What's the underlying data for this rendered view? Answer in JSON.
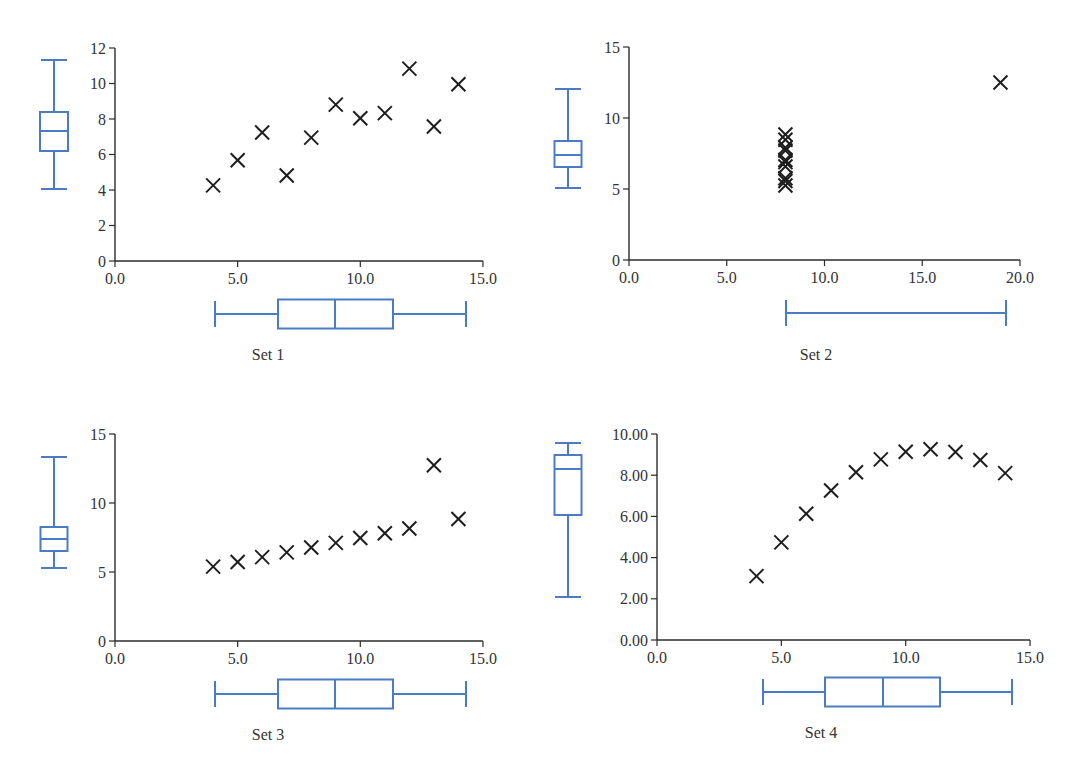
{
  "figure": {
    "accent_color": "#4a7cc4",
    "marker_color": "#1e1e1e",
    "marker": "x-cross"
  },
  "chart_data": [
    {
      "type": "scatter",
      "title": "Set 1",
      "xlabel": "",
      "ylabel": "",
      "xlim": [
        0,
        15
      ],
      "ylim": [
        0,
        12
      ],
      "xticks": [
        "0.0",
        "5.0",
        "10.0",
        "15.0"
      ],
      "xtick_values": [
        0,
        5,
        10,
        15
      ],
      "yticks": [
        "0",
        "2",
        "4",
        "6",
        "8",
        "10",
        "12"
      ],
      "ytick_values": [
        0,
        2,
        4,
        6,
        8,
        10,
        12
      ],
      "grid": false,
      "x": [
        10,
        8,
        13,
        9,
        11,
        14,
        6,
        4,
        12,
        7,
        5
      ],
      "y": [
        8.04,
        6.95,
        7.58,
        8.81,
        8.33,
        9.96,
        7.24,
        4.26,
        10.84,
        4.82,
        5.68
      ],
      "marginal_boxplot_x": {
        "min": 4,
        "q1": 6.5,
        "median": 9,
        "q3": 11.5,
        "max": 14
      },
      "marginal_boxplot_y": {
        "min": 4.26,
        "q1": 6.31,
        "median": 7.58,
        "q3": 8.57,
        "max": 10.84
      },
      "layout": {
        "ox": 115,
        "oy": 261,
        "xscale": 24.53,
        "yscale": 17.75,
        "vbox": {
          "cx": 54,
          "w": 28,
          "top": 60,
          "q3": 112,
          "med": 131,
          "q1": 151,
          "bot": 189
        },
        "hbox": {
          "cy": 314,
          "h": 29,
          "left": 215,
          "q1": 278,
          "med": 335,
          "q3": 393,
          "right": 466
        },
        "label": {
          "x": 268,
          "y": 360
        }
      }
    },
    {
      "type": "scatter",
      "title": "Set 2",
      "xlabel": "",
      "ylabel": "",
      "xlim": [
        0,
        20
      ],
      "ylim": [
        0,
        15
      ],
      "xticks": [
        "0.0",
        "5.0",
        "10.0",
        "15.0",
        "20.0"
      ],
      "xtick_values": [
        0,
        5,
        10,
        15,
        20
      ],
      "yticks": [
        "0",
        "5",
        "10",
        "15"
      ],
      "ytick_values": [
        0,
        5,
        10,
        15
      ],
      "grid": false,
      "x": [
        8,
        8,
        8,
        8,
        8,
        8,
        8,
        19,
        8,
        8,
        8
      ],
      "y": [
        6.58,
        5.76,
        7.71,
        8.84,
        8.47,
        7.04,
        5.25,
        12.5,
        5.56,
        7.91,
        6.89
      ],
      "marginal_boxplot_x": {
        "min": 8,
        "q1": 8,
        "median": 8,
        "q3": 8,
        "max": 19
      },
      "marginal_boxplot_y": {
        "min": 5.25,
        "q1": 6.17,
        "median": 7.04,
        "q3": 8.19,
        "max": 12.5
      },
      "layout": {
        "ox": 629,
        "oy": 260,
        "xscale": 19.55,
        "yscale": 14.2,
        "vbox": {
          "cx": 568,
          "w": 27,
          "top": 89,
          "q3": 141,
          "med": 155,
          "q1": 167,
          "bot": 188
        },
        "hbox": {
          "cy": 313,
          "h": 0,
          "left": 786,
          "q1": 786,
          "med": 786,
          "q3": 786,
          "right": 1006
        },
        "label": {
          "x": 816,
          "y": 360
        }
      }
    },
    {
      "type": "scatter",
      "title": "Set 3",
      "xlabel": "",
      "ylabel": "",
      "xlim": [
        0,
        15
      ],
      "ylim": [
        0,
        15
      ],
      "xticks": [
        "0.0",
        "5.0",
        "10.0",
        "15.0"
      ],
      "xtick_values": [
        0,
        5,
        10,
        15
      ],
      "yticks": [
        "0",
        "5",
        "10",
        "15"
      ],
      "ytick_values": [
        0,
        5,
        10,
        15
      ],
      "grid": false,
      "x": [
        10,
        8,
        13,
        9,
        11,
        14,
        6,
        4,
        12,
        7,
        5
      ],
      "y": [
        7.46,
        6.77,
        12.74,
        7.11,
        7.81,
        8.84,
        6.08,
        5.39,
        8.15,
        6.42,
        5.73
      ],
      "marginal_boxplot_x": {
        "min": 4,
        "q1": 6.5,
        "median": 9,
        "q3": 11.5,
        "max": 14
      },
      "marginal_boxplot_y": {
        "min": 5.39,
        "q1": 6.25,
        "median": 7.11,
        "q3": 7.98,
        "max": 12.74
      },
      "layout": {
        "ox": 115,
        "oy": 641,
        "xscale": 24.53,
        "yscale": 13.8,
        "vbox": {
          "cx": 54,
          "w": 27,
          "top": 457,
          "q3": 527,
          "med": 539,
          "q1": 551,
          "bot": 568
        },
        "hbox": {
          "cy": 694,
          "h": 29,
          "left": 215,
          "q1": 278,
          "med": 335,
          "q3": 393,
          "right": 466
        },
        "label": {
          "x": 268,
          "y": 740
        }
      }
    },
    {
      "type": "scatter",
      "title": "Set 4",
      "xlabel": "",
      "ylabel": "",
      "xlim": [
        0,
        15
      ],
      "ylim": [
        0,
        10
      ],
      "xticks": [
        "0.0",
        "5.0",
        "10.0",
        "15.0"
      ],
      "xtick_values": [
        0,
        5,
        10,
        15
      ],
      "yticks": [
        "0.00",
        "2.00",
        "4.00",
        "6.00",
        "8.00",
        "10.00"
      ],
      "ytick_values": [
        0,
        2,
        4,
        6,
        8,
        10
      ],
      "grid": false,
      "x": [
        10,
        8,
        13,
        9,
        11,
        14,
        6,
        4,
        12,
        7,
        5
      ],
      "y": [
        9.14,
        8.14,
        8.74,
        8.77,
        9.26,
        8.1,
        6.13,
        3.1,
        9.13,
        7.26,
        4.74
      ],
      "marginal_boxplot_x": {
        "min": 4,
        "q1": 6.5,
        "median": 9,
        "q3": 11.5,
        "max": 14
      },
      "marginal_boxplot_y": {
        "min": 3.1,
        "q1": 6.7,
        "median": 8.14,
        "q3": 8.95,
        "max": 9.26
      },
      "layout": {
        "ox": 657,
        "oy": 640,
        "xscale": 24.87,
        "yscale": 20.6,
        "vbox": {
          "cx": 568,
          "w": 27,
          "top": 443,
          "q3": 455,
          "med": 469,
          "q1": 515,
          "bot": 597
        },
        "hbox": {
          "cy": 692,
          "h": 29,
          "left": 763,
          "q1": 825,
          "med": 883,
          "q3": 940,
          "right": 1012
        },
        "label": {
          "x": 821,
          "y": 738
        }
      }
    }
  ]
}
